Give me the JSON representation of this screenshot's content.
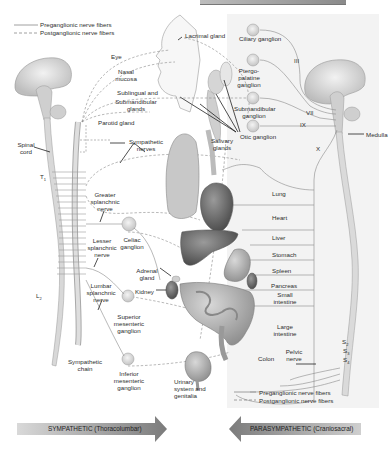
{
  "figure": {
    "type": "autonomic nervous system diagram",
    "legend_top": {
      "preganglionic": "Preganglionic nerve fibers",
      "postganglionic": "Postganglionic nerve fibers"
    },
    "legend_bottom": {
      "preganglionic": "Preganglionic nerve fibers",
      "postganglionic": "Postganglionic nerve fibers"
    },
    "sympathetic_side": {
      "labels": {
        "spinal_cord": "Spinal cord",
        "t1": "T",
        "t1_sub": "1",
        "l2": "L",
        "l2_sub": "2",
        "sympathetic_nerves": "Sympathetic nerves",
        "greater_splanchnic": "Greater splanchnic nerve",
        "lesser_splanchnic": "Lesser splanchnic nerve",
        "lumbar_splanchnic": "Lumbar splanchnic nerve",
        "celiac_ganglion": "Celiac ganglion",
        "superior_mesenteric": "Superior mesenteric ganglion",
        "inferior_mesenteric": "Inferior mesenteric ganglion",
        "sympathetic_chain": "Sympathetic chain",
        "adrenal_gland": "Adrenal gland",
        "kidney": "Kidney"
      }
    },
    "targets": {
      "eye": "Eye",
      "nasal_mucosa": "Nasal mucosa",
      "sublingual": "Sublingual and",
      "submandibular_glands": "Submandibular glands",
      "parotid_gland": "Parotid gland",
      "lacrimal_gland": "Lacrimal gland",
      "salivary_glands": "Salivary glands",
      "lung": "Lung",
      "heart": "Heart",
      "liver": "Liver",
      "stomach": "Stomach",
      "spleen": "Spleen",
      "pancreas": "Pancreas",
      "small_intestine": "Small intestine",
      "large_intestine": "Large intestine",
      "colon": "Colon",
      "urinary": "Urinary system and genitalia"
    },
    "parasympathetic_side": {
      "labels": {
        "ciliary_ganglion": "Ciliary ganglion",
        "pterygopalatine": "Ptergo- palatine ganglion",
        "submandibular_ganglion": "Submandibular ganglion",
        "otic_ganglion": "Otic ganglion",
        "medulla": "Medulla",
        "pelvic_nerve": "Pelvic nerve",
        "cn3": "III",
        "cn7": "VII",
        "cn9": "IX",
        "cn10": "X",
        "s2": "S",
        "s2_sub": "2",
        "s3": "S",
        "s3_sub": "3",
        "s4": "S",
        "s4_sub": "4"
      }
    },
    "arrows": {
      "sympathetic": "SYMPATHETIC (Thoracolumbar)",
      "parasympathetic": "PARASYMPATHETIC (Craniosacral)"
    },
    "colors": {
      "panel_bg": "#f3f3f3",
      "nerve_line": "#8a8a8a",
      "organ_dark": "#5a5a5a",
      "arrow_light": "#d6d6d6",
      "arrow_dark": "#7d7d7d"
    }
  }
}
